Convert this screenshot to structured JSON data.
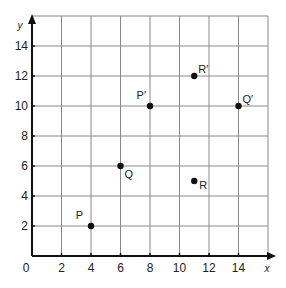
{
  "diagram": {
    "x_axis_label": "x",
    "y_axis_label": "y",
    "origin_label": "0",
    "x_ticks": [
      "2",
      "4",
      "6",
      "8",
      "10",
      "12",
      "14"
    ],
    "y_ticks": [
      "2",
      "4",
      "6",
      "8",
      "10",
      "12",
      "14"
    ],
    "points": [
      {
        "label": "P",
        "x": 4,
        "y": 2
      },
      {
        "label": "Q",
        "x": 6,
        "y": 6
      },
      {
        "label": "R",
        "x": 11,
        "y": 5
      },
      {
        "label": "P′",
        "x": 8,
        "y": 10
      },
      {
        "label": "Q′",
        "x": 14,
        "y": 10
      },
      {
        "label": "R′",
        "x": 11,
        "y": 12
      }
    ],
    "colors": {
      "grid": "#8a8a8a",
      "axis": "#111111",
      "point": "#111111"
    }
  },
  "chart_data": {
    "type": "scatter",
    "title": "",
    "xlabel": "x",
    "ylabel": "y",
    "xlim": [
      0,
      16
    ],
    "ylim": [
      0,
      16
    ],
    "grid": true,
    "grid_step": 2,
    "x_ticks": [
      2,
      4,
      6,
      8,
      10,
      12,
      14
    ],
    "y_ticks": [
      2,
      4,
      6,
      8,
      10,
      12,
      14
    ],
    "series": [
      {
        "name": "original",
        "points": [
          {
            "label": "P",
            "x": 4,
            "y": 2
          },
          {
            "label": "Q",
            "x": 6,
            "y": 6
          },
          {
            "label": "R",
            "x": 11,
            "y": 5
          }
        ]
      },
      {
        "name": "image",
        "points": [
          {
            "label": "P′",
            "x": 8,
            "y": 10
          },
          {
            "label": "Q′",
            "x": 14,
            "y": 10
          },
          {
            "label": "R′",
            "x": 11,
            "y": 12
          }
        ]
      }
    ]
  }
}
